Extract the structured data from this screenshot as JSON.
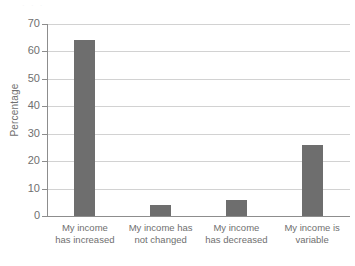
{
  "figure": {
    "scan_artifact_text": "· ·   ·",
    "bar_color": "#6e6e6e",
    "gridline_color": "#d2d2d2",
    "axis_color": "#8d8d8d",
    "text_color": "#6f6f6f",
    "background_color": "#ffffff"
  },
  "chart_data": {
    "type": "bar",
    "title": "",
    "xlabel": "",
    "ylabel": "Percentage",
    "ylim": [
      0,
      70
    ],
    "yticks": [
      0,
      10,
      20,
      30,
      40,
      50,
      60,
      70
    ],
    "ytick_labels": [
      "0",
      "10",
      "20",
      "30",
      "40",
      "50",
      "60",
      "70"
    ],
    "grid": true,
    "legend": "none",
    "categories": [
      "My income has increased",
      "My income has not changed",
      "My income has decreased",
      "My income is variable"
    ],
    "category_lines": [
      [
        "My income",
        "has increased"
      ],
      [
        "My income has",
        "not changed"
      ],
      [
        "My income",
        "has decreased"
      ],
      [
        "My income is",
        "variable"
      ]
    ],
    "values": [
      64,
      4,
      6,
      26
    ]
  }
}
